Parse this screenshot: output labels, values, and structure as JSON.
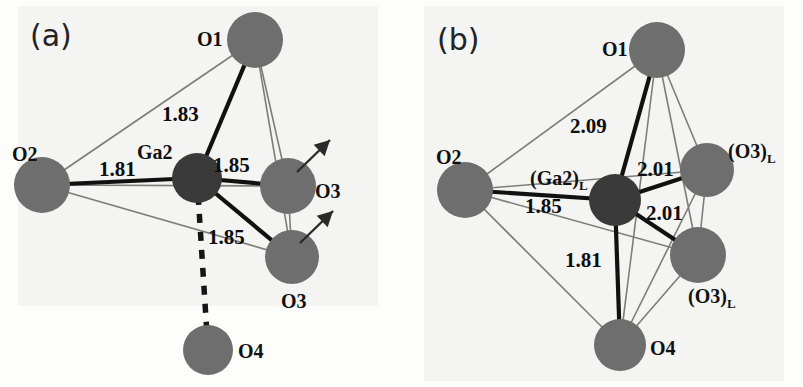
{
  "figure": {
    "background_color": "#fdfdfc",
    "panel_tint": "#f4f4f2",
    "atom_oxygen_color": "#6e6e6e",
    "atom_gallium_color": "#3a3a3a",
    "bond_strong_color": "#111111",
    "bond_thin_color": "#7d7d7d",
    "dashed_bond_color": "#151515",
    "arrow_color": "#2a2a2a"
  },
  "panels": [
    {
      "id": "a",
      "tag": "(a)",
      "tag_x": 30,
      "tag_y": 18,
      "center_atom": {
        "name": "Ga2",
        "label": "Ga2",
        "sub": "",
        "cx": 197,
        "cy": 178,
        "r": 25,
        "kind": "gallium",
        "label_x": 137,
        "label_y": 141
      },
      "atoms": [
        {
          "name": "O1",
          "label": "O1",
          "sub": "",
          "cx": 255,
          "cy": 40,
          "r": 28,
          "kind": "oxygen",
          "label_x": 197,
          "label_y": 28
        },
        {
          "name": "O2",
          "label": "O2",
          "sub": "",
          "cx": 42,
          "cy": 185,
          "r": 28,
          "kind": "oxygen",
          "label_x": 12,
          "label_y": 143
        },
        {
          "name": "O3-upper",
          "label": "O3",
          "sub": "",
          "cx": 288,
          "cy": 186,
          "r": 28,
          "kind": "oxygen",
          "label_x": 315,
          "label_y": 180
        },
        {
          "name": "O3-lower",
          "label": "O3",
          "sub": "",
          "cx": 292,
          "cy": 257,
          "r": 27,
          "kind": "oxygen",
          "label_x": 281,
          "label_y": 290
        },
        {
          "name": "O4",
          "label": "O4",
          "sub": "",
          "cx": 208,
          "cy": 350,
          "r": 25,
          "kind": "oxygen",
          "label_x": 238,
          "label_y": 340
        }
      ],
      "bonds": [
        {
          "from": "Ga2",
          "to": "O1",
          "style": "strong",
          "distance": "1.83",
          "label_x": 162,
          "label_y": 102
        },
        {
          "from": "Ga2",
          "to": "O2",
          "style": "strong",
          "distance": "1.81",
          "label_x": 99,
          "label_y": 157
        },
        {
          "from": "Ga2",
          "to": "O3-upper",
          "style": "strong",
          "distance": "1.85",
          "label_x": 213,
          "label_y": 153
        },
        {
          "from": "Ga2",
          "to": "O3-lower",
          "style": "strong",
          "distance": "1.85",
          "label_x": 208,
          "label_y": 225
        },
        {
          "from": "Ga2",
          "to": "O4",
          "style": "dashed",
          "distance": "",
          "label_x": 0,
          "label_y": 0
        }
      ],
      "edges": [
        {
          "from": "O2",
          "to": "O1",
          "style": "thin"
        },
        {
          "from": "O2",
          "to": "O3-upper",
          "style": "thin"
        },
        {
          "from": "O2",
          "to": "O3-lower",
          "style": "thin"
        },
        {
          "from": "O1",
          "to": "O3-upper",
          "style": "thin"
        },
        {
          "from": "O1",
          "to": "O3-lower",
          "style": "thin"
        },
        {
          "from": "O3-upper",
          "to": "O3-lower",
          "style": "thin"
        }
      ],
      "arrows": [
        {
          "name": "displacement-arrow-o3-upper",
          "x1": 297,
          "y1": 172,
          "x2": 330,
          "y2": 140
        },
        {
          "name": "displacement-arrow-o3-lower",
          "x1": 300,
          "y1": 243,
          "x2": 333,
          "y2": 211
        }
      ]
    },
    {
      "id": "b",
      "tag": "(b)",
      "tag_x": 437,
      "tag_y": 22,
      "center_atom": {
        "name": "Ga2L",
        "label": "(Ga2)",
        "sub": "L",
        "cx": 615,
        "cy": 200,
        "r": 26,
        "kind": "gallium",
        "label_x": 530,
        "label_y": 167
      },
      "atoms": [
        {
          "name": "O1",
          "label": "O1",
          "sub": "",
          "cx": 657,
          "cy": 50,
          "r": 28,
          "kind": "oxygen",
          "label_x": 602,
          "label_y": 38
        },
        {
          "name": "O2",
          "label": "O2",
          "sub": "",
          "cx": 465,
          "cy": 190,
          "r": 28,
          "kind": "oxygen",
          "label_x": 436,
          "label_y": 146
        },
        {
          "name": "O3L-upper",
          "label": "(O3)",
          "sub": "L",
          "cx": 707,
          "cy": 170,
          "r": 27,
          "kind": "oxygen",
          "label_x": 728,
          "label_y": 140
        },
        {
          "name": "O3L-lower",
          "label": "(O3)",
          "sub": "L",
          "cx": 698,
          "cy": 255,
          "r": 28,
          "kind": "oxygen",
          "label_x": 688,
          "label_y": 285
        },
        {
          "name": "O4",
          "label": "O4",
          "sub": "",
          "cx": 620,
          "cy": 345,
          "r": 26,
          "kind": "oxygen",
          "label_x": 650,
          "label_y": 337
        }
      ],
      "bonds": [
        {
          "from": "Ga2L",
          "to": "O1",
          "style": "strong",
          "distance": "2.09",
          "label_x": 570,
          "label_y": 114
        },
        {
          "from": "Ga2L",
          "to": "O2",
          "style": "strong",
          "distance": "1.85",
          "label_x": 525,
          "label_y": 194
        },
        {
          "from": "Ga2L",
          "to": "O3L-upper",
          "style": "strong",
          "distance": "2.01",
          "label_x": 637,
          "label_y": 157
        },
        {
          "from": "Ga2L",
          "to": "O3L-lower",
          "style": "strong",
          "distance": "2.01",
          "label_x": 646,
          "label_y": 201
        },
        {
          "from": "Ga2L",
          "to": "O4",
          "style": "strong",
          "distance": "1.81",
          "label_x": 565,
          "label_y": 248
        }
      ],
      "edges": [
        {
          "from": "O2",
          "to": "O1",
          "style": "thin"
        },
        {
          "from": "O2",
          "to": "O3L-upper",
          "style": "thin"
        },
        {
          "from": "O2",
          "to": "O3L-lower",
          "style": "thin"
        },
        {
          "from": "O2",
          "to": "O4",
          "style": "thin"
        },
        {
          "from": "O1",
          "to": "O3L-upper",
          "style": "thin"
        },
        {
          "from": "O1",
          "to": "O3L-lower",
          "style": "thin"
        },
        {
          "from": "O1",
          "to": "O4",
          "style": "thin"
        },
        {
          "from": "O3L-upper",
          "to": "O3L-lower",
          "style": "thin"
        },
        {
          "from": "O3L-upper",
          "to": "O4",
          "style": "thin"
        },
        {
          "from": "O3L-lower",
          "to": "O4",
          "style": "thin"
        }
      ],
      "arrows": []
    }
  ]
}
